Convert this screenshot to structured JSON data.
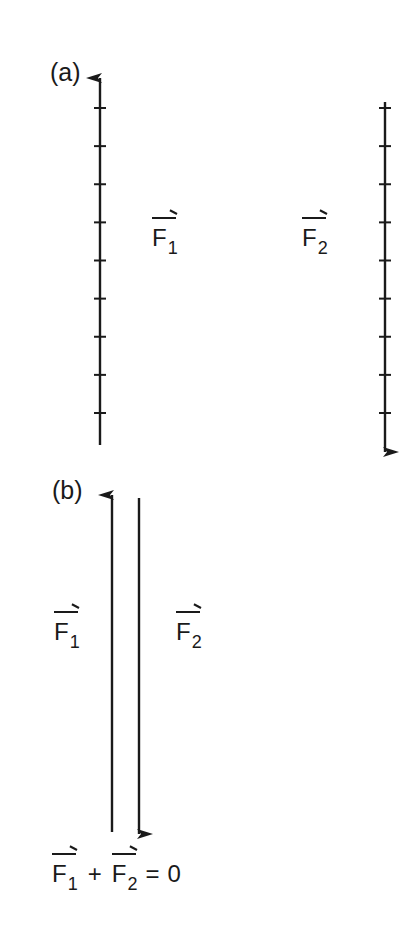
{
  "figure": {
    "part_a": {
      "label": "(a)",
      "vectors": [
        {
          "name": "F1",
          "symbol": "F",
          "subscript": "1",
          "direction": "up",
          "tick_count": 9
        },
        {
          "name": "F2",
          "symbol": "F",
          "subscript": "2",
          "direction": "down",
          "tick_count": 9
        }
      ]
    },
    "part_b": {
      "label": "(b)",
      "vectors": [
        {
          "name": "F1",
          "symbol": "F",
          "subscript": "1",
          "direction": "up"
        },
        {
          "name": "F2",
          "symbol": "F",
          "subscript": "2",
          "direction": "down"
        }
      ],
      "equation": {
        "term1_symbol": "F",
        "term1_subscript": "1",
        "operator": "+",
        "term2_symbol": "F",
        "term2_subscript": "2",
        "equals": "=",
        "result": "0"
      }
    }
  }
}
